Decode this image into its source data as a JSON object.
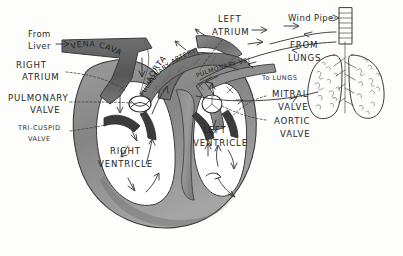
{
  "diagram": {
    "background_color": "#fdfdfc",
    "ink_color": "#2b2b2b",
    "muscle_shade_color": "#8d8d8d"
  },
  "labels": {
    "from_liver": "From\nLiver",
    "from_liver_line1": "From",
    "from_liver_line2": "Liver",
    "right_atrium_line1": "RIGHT",
    "right_atrium_line2": "ATRIUM",
    "pulmonary_valve_line1": "PULMONARY",
    "pulmonary_valve_line2": "VALVE",
    "tricuspid_valve_line1": "TRI-CUSPID",
    "tricuspid_valve_line2": "VALVE",
    "right_ventricle_line1": "RIGHT",
    "right_ventricle_line2": "VENTRICLE",
    "left_ventricle_line1": "LEFT",
    "left_ventricle_line2": "VENTRICLE",
    "left_atrium_line1": "LEFT",
    "left_atrium_line2": "ATRIUM",
    "mitral_valve_line1": "MITRAL",
    "mitral_valve_line2": "VALVE",
    "aortic_valve_line1": "AORTIC",
    "aortic_valve_line2": "VALVE",
    "from_lungs_line1": "FROM",
    "from_lungs_line2": "LUNGS",
    "to_lungs": "To LUNGS",
    "wind_pipe": "Wind Pipe",
    "vena_cava": "VENA CAVA",
    "aorta": "AORTA",
    "pulmonary_artery": "PULMONARY ARTERY",
    "pulmonary_vein": "PULMONARY VEIN"
  },
  "structures": {
    "heart": "heart-cross-section",
    "lungs": "lungs-pair",
    "trachea": "wind-pipe-trachea",
    "vessels": [
      "vena-cava",
      "aorta",
      "pulmonary-artery",
      "pulmonary-vein"
    ],
    "chambers": [
      "right-atrium",
      "right-ventricle",
      "left-atrium",
      "left-ventricle"
    ],
    "valves": [
      "pulmonary-valve",
      "tri-cuspid-valve",
      "mitral-valve",
      "aortic-valve"
    ]
  }
}
